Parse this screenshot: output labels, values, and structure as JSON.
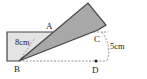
{
  "diagram": {
    "type": "geometry-folding",
    "points": {
      "A": {
        "label": "A"
      },
      "B": {
        "label": "B"
      },
      "C": {
        "label": "C"
      },
      "D": {
        "label": "D"
      }
    },
    "measurements": {
      "rect_side": "8cm",
      "height": "5cm"
    },
    "colors": {
      "rect_fill": "#e4e4e4",
      "strip_fill": "#a8a8a8",
      "stroke": "#444444",
      "dashed": "#777777"
    }
  }
}
